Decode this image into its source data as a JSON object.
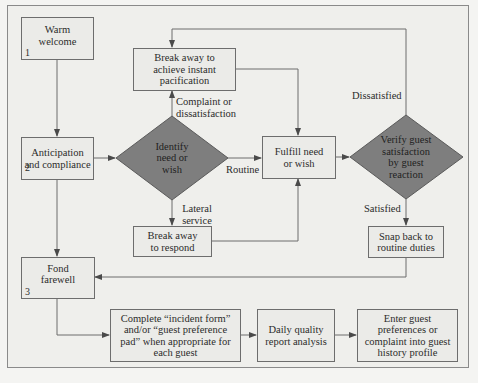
{
  "colors": {
    "decision_fill": "#7e7e7e",
    "line": "#6d6d6d",
    "box_fill": "#ebebe8"
  },
  "nodes": {
    "warm_welcome": {
      "text": "Warm welcome",
      "num": "1"
    },
    "anticipation": {
      "text": "Anticipation and compliance",
      "num": "2"
    },
    "fond_farewell": {
      "text": "Fond farewell",
      "num": "3"
    },
    "break_instant": {
      "text": "Break away to achieve instant pacification"
    },
    "identify": {
      "text": "Identify need or wish"
    },
    "fulfill": {
      "text": "Fulfill need or wish"
    },
    "verify": {
      "text": "Verify guest satisfaction by guest reaction"
    },
    "break_respond": {
      "text": "Break away to respond"
    },
    "snap_back": {
      "text": "Snap back to routine duties"
    },
    "complete_form": {
      "text": "Complete “incident form” and/or “guest preference pad” when appropriate for each guest"
    },
    "daily_quality": {
      "text": "Daily quality report analysis"
    },
    "enter_guest": {
      "text": "Enter guest preferences or complaint into guest history profile"
    }
  },
  "edge_labels": {
    "complaint": "Complaint or dissatisfaction",
    "routine": "Routine",
    "lateral": "Lateral service",
    "dissatisfied": "Dissatisfied",
    "satisfied": "Satisfied"
  }
}
